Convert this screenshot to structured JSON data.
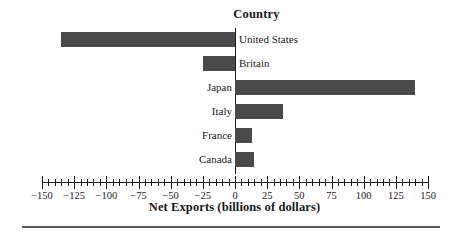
{
  "chart_data": {
    "type": "bar",
    "orientation": "horizontal",
    "title": "Country",
    "subtitle": "",
    "xlabel": "Net Exports (billions of dollars)",
    "ylabel": "Country",
    "categories": [
      "United States",
      "Britain",
      "Japan",
      "Italy",
      "France",
      "Canada"
    ],
    "values": [
      -135,
      -25,
      140,
      37,
      13,
      15
    ],
    "series": [
      {
        "name": "Net Exports",
        "values": [
          -135,
          -25,
          140,
          37,
          13,
          15
        ]
      }
    ],
    "xlim": [
      -150,
      150
    ],
    "xticks": [
      -150,
      -125,
      -100,
      -75,
      -50,
      -25,
      0,
      25,
      50,
      75,
      100,
      125,
      150
    ],
    "xtick_labels": [
      "−150",
      "−125",
      "−100",
      "−75",
      "−50",
      "−25",
      "0",
      "25",
      "50",
      "75",
      "100",
      "125",
      "150"
    ],
    "minor_tick_interval": 5,
    "grid": false,
    "legend": false,
    "legend_position": "none",
    "bar_color": "#4a4a4a",
    "axis_color": "#1a1a1a",
    "background_color": "#ffffff",
    "annotations": []
  },
  "chart": {
    "title": "Country",
    "axis_title": "Net Exports (billions of dollars)",
    "bars": [
      {
        "label": "United States",
        "value": -135,
        "label_side": "right"
      },
      {
        "label": "Britain",
        "value": -25,
        "label_side": "right"
      },
      {
        "label": "Japan",
        "value": 140,
        "label_side": "left"
      },
      {
        "label": "Italy",
        "value": 37,
        "label_side": "left"
      },
      {
        "label": "France",
        "value": 13,
        "label_side": "left"
      },
      {
        "label": "Canada",
        "value": 15,
        "label_side": "left"
      }
    ],
    "tick_labels": [
      "−150",
      "−125",
      "−100",
      "−75",
      "−50",
      "−25",
      "0",
      "25",
      "50",
      "75",
      "100",
      "125",
      "150"
    ]
  }
}
